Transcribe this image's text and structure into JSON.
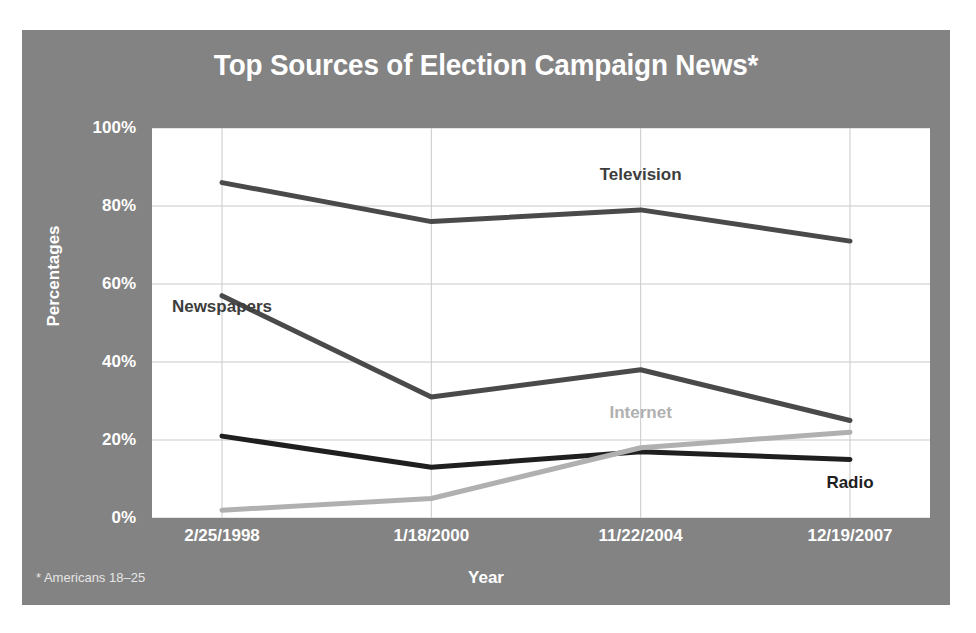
{
  "figure": {
    "title": "Top Sources of Election Campaign News*",
    "footnote": "* Americans 18–25",
    "background_color": "#838383",
    "plot_background_color": "#ffffff",
    "title_color": "#ffffff",
    "axis_text_color": "#ffffff"
  },
  "chart_data": {
    "type": "line",
    "title": "Top Sources of Election Campaign News*",
    "xlabel": "Year",
    "ylabel": "Percentages",
    "categories": [
      "2/25/1998",
      "1/18/2000",
      "11/22/2004",
      "12/19/2007"
    ],
    "ylim": [
      0,
      100
    ],
    "yticks": [
      0,
      20,
      40,
      60,
      80,
      100
    ],
    "ytick_labels": [
      "0%",
      "20%",
      "40%",
      "60%",
      "80%",
      "100%"
    ],
    "grid": true,
    "legend_position": "inline-labels",
    "footnote": "* Americans 18–25",
    "series": [
      {
        "name": "Television",
        "values": [
          86,
          76,
          79,
          71
        ],
        "color": "#4a4a4a",
        "label_x_index": 2,
        "label_y": 88
      },
      {
        "name": "Newspapers",
        "values": [
          57,
          31,
          38,
          25
        ],
        "color": "#4a4a4a",
        "label_x_index": 0,
        "label_y": 54
      },
      {
        "name": "Radio",
        "values": [
          21,
          13,
          17,
          15
        ],
        "color": "#1f1f1f",
        "label_x_index": 3,
        "label_y": 9
      },
      {
        "name": "Internet",
        "values": [
          2,
          5,
          18,
          22
        ],
        "color": "#b0b0b0",
        "label_x_index": 2,
        "label_y": 27
      }
    ]
  }
}
